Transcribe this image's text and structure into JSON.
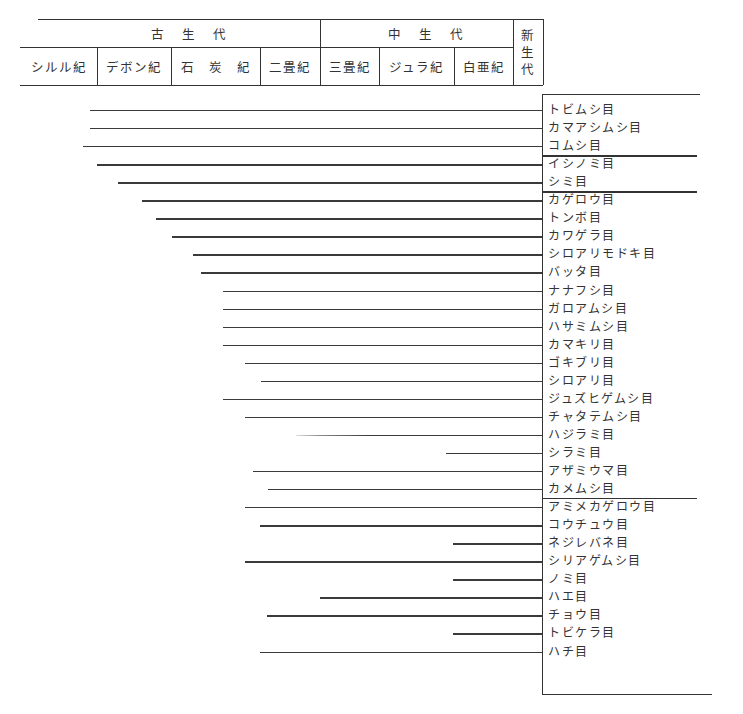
{
  "header": {
    "eras": [
      {
        "label": "古　生　代",
        "x": 38,
        "w": 282
      },
      {
        "label": "中　生　代",
        "x": 320,
        "w": 193
      },
      {
        "label": "新生代",
        "x": 513,
        "w": 30,
        "vertical": [
          "新",
          "生",
          "代"
        ]
      }
    ],
    "periods": [
      {
        "label": "シルル紀",
        "x": 20,
        "w": 77
      },
      {
        "label": "デボン紀",
        "x": 97,
        "w": 74
      },
      {
        "label": "石　炭　紀",
        "x": 171,
        "w": 89
      },
      {
        "label": "二畳紀",
        "x": 260,
        "w": 60
      },
      {
        "label": "三畳紀",
        "x": 320,
        "w": 59
      },
      {
        "label": "ジュラ紀",
        "x": 379,
        "w": 75
      },
      {
        "label": "白亜紀",
        "x": 454,
        "w": 59
      }
    ]
  },
  "chart_data": {
    "type": "range-lines",
    "axis": [
      "シルル紀",
      "デボン紀",
      "石炭紀",
      "二畳紀",
      "三畳紀",
      "ジュラ紀",
      "白亜紀",
      "新生代"
    ],
    "groups": [
      {
        "name": "group-1",
        "orders": [
          "トビムシ目",
          "カマアシムシ目",
          "コムシ目"
        ]
      },
      {
        "name": "group-2",
        "orders": [
          "イシノミ目",
          "シミ目"
        ]
      },
      {
        "name": "group-3",
        "orders": [
          "カゲロウ目",
          "トンボ目",
          "カワゲラ目",
          "シロアリモドキ目",
          "バッタ目",
          "ナナフシ目",
          "ガロアムシ目",
          "ハサミムシ目",
          "カマキリ目",
          "ゴキブリ目",
          "シロアリ目",
          "ジュズヒゲムシ目",
          "チャタテムシ目",
          "ハジラミ目",
          "シラミ目",
          "アザミウマ目",
          "カメムシ目"
        ]
      },
      {
        "name": "group-4",
        "orders": [
          "アミメカゲロウ目",
          "コウチュウ目",
          "ネジレバネ目",
          "シリアゲムシ目",
          "ノミ目",
          "ハエ目",
          "チョウ目",
          "トビケラ目",
          "ハチ目"
        ]
      }
    ],
    "rows": [
      {
        "label": "トビムシ目",
        "start_x": 90,
        "start_period": "デボン紀"
      },
      {
        "label": "カマアシムシ目",
        "start_x": 90,
        "start_period": "デボン紀"
      },
      {
        "label": "コムシ目",
        "start_x": 83,
        "start_period": "シルル紀"
      },
      {
        "label": "イシノミ目",
        "start_x": 97,
        "start_period": "デボン紀"
      },
      {
        "label": "シミ目",
        "start_x": 118,
        "start_period": "デボン紀"
      },
      {
        "label": "カゲロウ目",
        "start_x": 142,
        "start_period": "デボン紀"
      },
      {
        "label": "トンボ目",
        "start_x": 156,
        "start_period": "デボン紀"
      },
      {
        "label": "カワゲラ目",
        "start_x": 172,
        "start_period": "石炭紀"
      },
      {
        "label": "シロアリモドキ目",
        "start_x": 193,
        "start_period": "石炭紀"
      },
      {
        "label": "バッタ目",
        "start_x": 201,
        "start_period": "石炭紀"
      },
      {
        "label": "ナナフシ目",
        "start_x": 223,
        "start_period": "石炭紀"
      },
      {
        "label": "ガロアムシ目",
        "start_x": 223,
        "start_period": "石炭紀"
      },
      {
        "label": "ハサミムシ目",
        "start_x": 223,
        "start_period": "石炭紀"
      },
      {
        "label": "カマキリ目",
        "start_x": 223,
        "start_period": "石炭紀"
      },
      {
        "label": "ゴキブリ目",
        "start_x": 245,
        "start_period": "石炭紀"
      },
      {
        "label": "シロアリ目",
        "start_x": 261,
        "start_period": "二畳紀"
      },
      {
        "label": "ジュズヒゲムシ目",
        "start_x": 223,
        "start_period": "石炭紀"
      },
      {
        "label": "チャタテムシ目",
        "start_x": 245,
        "start_period": "石炭紀"
      },
      {
        "label": "ハジラミ目",
        "start_x": 296,
        "start_period": "二畳紀",
        "faint": true
      },
      {
        "label": "シラミ目",
        "start_x": 446,
        "start_period": "ジュラ紀"
      },
      {
        "label": "アザミウマ目",
        "start_x": 253,
        "start_period": "石炭紀"
      },
      {
        "label": "カメムシ目",
        "start_x": 268,
        "start_period": "二畳紀"
      },
      {
        "label": "アミメカゲロウ目",
        "start_x": 245,
        "start_period": "石炭紀"
      },
      {
        "label": "コウチュウ目",
        "start_x": 260,
        "start_period": "二畳紀"
      },
      {
        "label": "ネジレバネ目",
        "start_x": 453,
        "start_period": "白亜紀"
      },
      {
        "label": "シリアゲムシ目",
        "start_x": 245,
        "start_period": "石炭紀"
      },
      {
        "label": "ノミ目",
        "start_x": 453,
        "start_period": "白亜紀"
      },
      {
        "label": "ハエ目",
        "start_x": 320,
        "start_period": "三畳紀"
      },
      {
        "label": "チョウ目",
        "start_x": 267,
        "start_period": "二畳紀"
      },
      {
        "label": "トビケラ目",
        "start_x": 453,
        "start_period": "白亜紀"
      },
      {
        "label": "ハチ目",
        "start_x": 260,
        "start_period": "二畳紀"
      }
    ],
    "end_x": 542,
    "group_dividers_after": [
      2,
      4,
      21
    ]
  }
}
